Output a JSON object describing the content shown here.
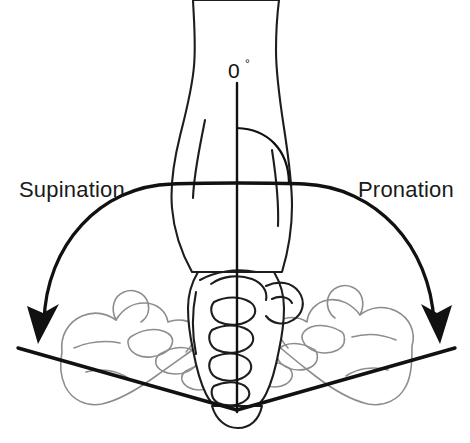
{
  "figure": {
    "background_color": "#ffffff",
    "width": 470,
    "height": 443
  },
  "labels": {
    "left": "Supination",
    "right": "Pronation",
    "neutral_value": "0",
    "neutral_unit": "°"
  },
  "colors": {
    "ink": "#111111",
    "arm_outline": "#1d1d1d",
    "ghost_outline": "#8d8d8d",
    "text": "#1a1a1a",
    "paper": "#ffffff"
  },
  "annotations": {
    "neutral_axis_name": "vertical-zero-degree-reference-line",
    "left_rotation_direction": "counterclockwise-toward-palm-up",
    "right_rotation_direction": "clockwise-toward-palm-down",
    "arc_span_degrees": 180,
    "left_arc_degrees": 90,
    "right_arc_degrees": 90
  },
  "elements": {
    "center_hand": "neutral-fist-thumb-up",
    "left_hand": "supinated-hand-palm-up-ghost",
    "right_hand": "pronated-hand-palm-down-ghost",
    "forearm": "forearm-vertical",
    "baseline": "horizontal-reference-plane"
  }
}
